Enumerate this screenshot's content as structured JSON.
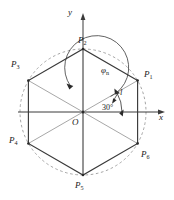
{
  "figure": {
    "axes": {
      "x_label": "x",
      "y_label": "y",
      "origin_label": "O"
    },
    "annotations": {
      "angle_label": "30°",
      "phi_label": "φ",
      "phi_subscript": "n",
      "side_label": "l"
    },
    "vertices": [
      {
        "id": "P1",
        "base": "P",
        "sub": "1",
        "angle_deg": 30,
        "label_dx": 9,
        "label_dy": -8
      },
      {
        "id": "P2",
        "base": "P",
        "sub": "2",
        "angle_deg": 90,
        "label_dx": -2,
        "label_dy": -14
      },
      {
        "id": "P3",
        "base": "P",
        "sub": "3",
        "angle_deg": 150,
        "label_dx": -17,
        "label_dy": -9
      },
      {
        "id": "P4",
        "base": "P",
        "sub": "4",
        "angle_deg": 210,
        "label_dx": -18,
        "label_dy": 0
      },
      {
        "id": "P5",
        "base": "P",
        "sub": "5",
        "angle_deg": 270,
        "label_dx": -4,
        "label_dy": 8
      },
      {
        "id": "P6",
        "base": "P",
        "sub": "6",
        "angle_deg": 330,
        "label_dx": 8,
        "label_dy": 6
      }
    ],
    "geometry": {
      "center_x": 83,
      "center_y": 112,
      "radius": 63,
      "x_axis_end": 164,
      "y_axis_top": 16
    },
    "colors": {
      "stroke": "#3a3a3a",
      "dashed": "#8a8a8a",
      "spoke": "#7a7a7a",
      "text": "#1a1a1a",
      "background": "#ffffff"
    }
  }
}
